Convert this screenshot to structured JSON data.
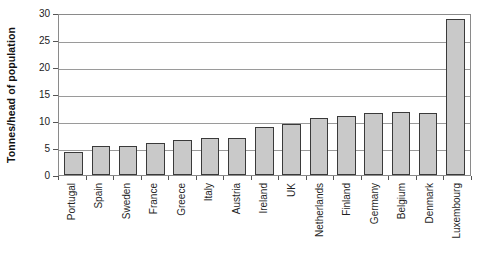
{
  "chart_data": {
    "type": "bar",
    "title": "",
    "subtitle": "",
    "xlabel": "",
    "ylabel": "Tonnes/head of population",
    "ylim": [
      0,
      30
    ],
    "ytick_step": 5,
    "yticks": [
      30,
      25,
      20,
      15,
      10,
      5,
      0
    ],
    "grid": true,
    "legend": "none",
    "bar_fill_color": "#C9C9C9",
    "bar_border_color": "#3A3A3A",
    "plot_border_color": "#8A8A8A",
    "gridline_color": "#9A9A9A",
    "categories": [
      "Portugal",
      "Spain",
      "Sweden",
      "France",
      "Greece",
      "Italy",
      "Austria",
      "Ireland",
      "UK",
      "Netherlands",
      "Finland",
      "Germany",
      "Belgium",
      "Denmark",
      "Luxembourg"
    ],
    "values": [
      4.3,
      5.3,
      5.4,
      5.9,
      6.4,
      6.9,
      6.9,
      8.9,
      9.5,
      10.6,
      11.0,
      11.4,
      11.6,
      11.4,
      28.8
    ]
  }
}
